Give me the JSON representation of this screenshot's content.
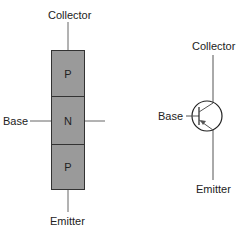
{
  "pnp_block": {
    "regions": [
      {
        "label": "P",
        "role": "collector"
      },
      {
        "label": "N",
        "role": "base"
      },
      {
        "label": "P",
        "role": "emitter"
      }
    ],
    "labels": {
      "collector": "Collector",
      "base": "Base",
      "emitter": "Emitter"
    },
    "colors": {
      "fill": "#9a9a9a",
      "stroke": "#333333"
    }
  },
  "pnp_symbol": {
    "labels": {
      "collector": "Collector",
      "base": "Base",
      "emitter": "Emitter"
    }
  }
}
